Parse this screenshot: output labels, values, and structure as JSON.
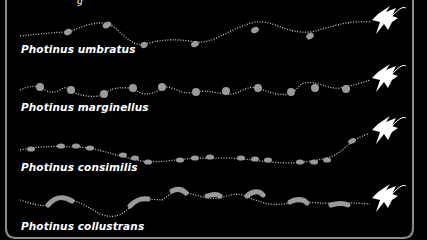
{
  "figure": {
    "title_fragment": "g",
    "colors": {
      "background": "#000000",
      "flash": "#9a9a9a",
      "trail": "#d8d8d8",
      "firefly": "#ffffff",
      "border": "#8a8a8a"
    },
    "species": [
      {
        "name": "Photinus umbratus",
        "flash_pattern": "short dashes on wavy climbing path",
        "flash_count": 6
      },
      {
        "name": "Photinus marginellus",
        "flash_pattern": "round dots on zig-zag path",
        "flash_count": 11
      },
      {
        "name": "Photinus consimilis",
        "flash_pattern": "rapid pulse train of ovals",
        "flash_count": 14
      },
      {
        "name": "Photinus collustrans",
        "flash_pattern": "long curved streaks",
        "flash_count": 6
      }
    ]
  }
}
